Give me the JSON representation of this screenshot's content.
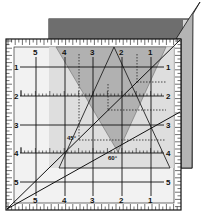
{
  "diagram": {
    "colors": {
      "fabric_top_band": "#6e6e6e",
      "fabric_body": "#d4d4d4",
      "fabric_flap": "#b4b4b4",
      "triangle_fill": "#9a9a9a",
      "ruler_frame": "#ffffff",
      "ruler_interior": "#ececec",
      "line": "#111111"
    },
    "top_labels": [
      "5",
      "4",
      "3",
      "2",
      "1"
    ],
    "bottom_labels": [
      "5",
      "4",
      "3",
      "2",
      "1"
    ],
    "left_labels": [
      "1",
      "2",
      "3",
      "4",
      "5"
    ],
    "right_labels": [
      "1",
      "2",
      "3",
      "4",
      "5"
    ],
    "angle_labels": {
      "a45": "45°",
      "a60": "60°"
    }
  }
}
